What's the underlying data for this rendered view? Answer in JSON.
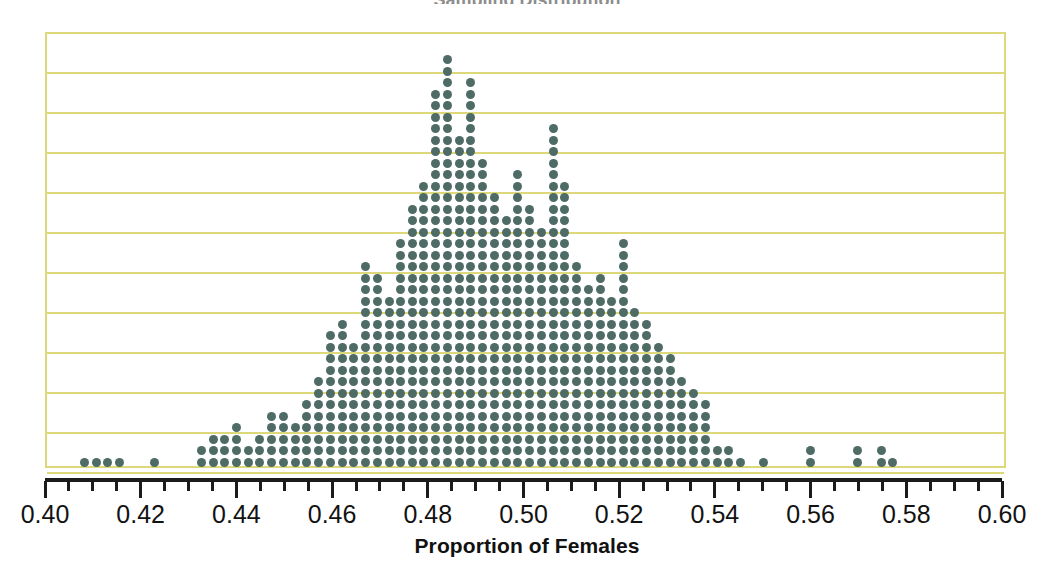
{
  "figure": {
    "width": 1054,
    "height": 566,
    "background": "#ffffff",
    "cropped_title_fragment": "Sampling Distribution"
  },
  "colors": {
    "dot": "#4e6b66",
    "gridline": "#ddd97a",
    "plot_border": "#ddd97a",
    "axis": "#1b1b1b",
    "text": "#121212",
    "background": "#ffffff"
  },
  "plot_box": {
    "left": 45,
    "top": 32,
    "right": 1006,
    "bottom": 468,
    "gridline_count": 11,
    "gridline_spacing_px": 40
  },
  "axis": {
    "line_y": 478,
    "x_min_px": 45,
    "x_max_px": 1002,
    "major_step": 0.02,
    "minor_step": 0.005,
    "title": "Proportion of Females",
    "tick_labels": [
      "0.40",
      "0.42",
      "0.44",
      "0.46",
      "0.48",
      "0.50",
      "0.52",
      "0.54",
      "0.56",
      "0.58",
      "0.60"
    ],
    "tick_values": [
      0.4,
      0.42,
      0.44,
      0.46,
      0.48,
      0.5,
      0.52,
      0.54,
      0.56,
      0.58,
      0.6
    ]
  },
  "dot_geometry": {
    "diameter_px": 9,
    "column_pitch_px": 11.7,
    "row_pitch_px": 11.5,
    "baseline_y_px": 462
  },
  "chart_data": {
    "type": "scatter",
    "plot_style": "dot-plot (stacked dots, one dot per observation)",
    "title": "",
    "xlabel": "Proportion of Females",
    "ylabel": "",
    "xlim": [
      0.4,
      0.6
    ],
    "ylim": [
      0,
      36
    ],
    "grid": "horizontal-only",
    "legend": "none",
    "x_tick_labels": [
      "0.40",
      "0.42",
      "0.44",
      "0.46",
      "0.48",
      "0.50",
      "0.52",
      "0.54",
      "0.56",
      "0.58",
      "0.60"
    ],
    "y_tick_labels": [],
    "annotations": [],
    "x_bin_width": 0.00245,
    "x": [
      0.4082,
      0.4107,
      0.4131,
      0.4156,
      0.4229,
      0.4327,
      0.4352,
      0.4376,
      0.44,
      0.4425,
      0.4449,
      0.4474,
      0.4498,
      0.4523,
      0.4547,
      0.4572,
      0.4596,
      0.4621,
      0.4645,
      0.467,
      0.4694,
      0.4719,
      0.4743,
      0.4768,
      0.4792,
      0.4817,
      0.4841,
      0.4866,
      0.489,
      0.4915,
      0.4939,
      0.4964,
      0.4988,
      0.5013,
      0.5037,
      0.5062,
      0.5086,
      0.5111,
      0.5135,
      0.516,
      0.5184,
      0.5209,
      0.5233,
      0.5258,
      0.5282,
      0.5307,
      0.5331,
      0.5356,
      0.538,
      0.5405,
      0.5429,
      0.5454,
      0.5502,
      0.56,
      0.5699,
      0.5748,
      0.5772
    ],
    "counts": [
      1,
      1,
      1,
      1,
      1,
      2,
      3,
      3,
      4,
      2,
      3,
      5,
      5,
      4,
      6,
      8,
      12,
      13,
      11,
      18,
      17,
      15,
      20,
      23,
      25,
      33,
      36,
      29,
      34,
      27,
      24,
      22,
      26,
      23,
      21,
      30,
      25,
      18,
      16,
      17,
      15,
      20,
      14,
      13,
      11,
      10,
      8,
      7,
      6,
      2,
      2,
      1,
      1,
      2,
      2,
      2,
      1
    ],
    "summary": {
      "n_observations_approx": 705,
      "center_approx": 0.487,
      "mode_bin": 0.4866,
      "max_stack_height": 36,
      "min_value": 0.4082,
      "max_value": 0.5772,
      "notable_features": [
        "tall isolated spike at 0.5062 reaching 30 dots",
        "secondary bump near 0.5209 reaching 20 dots",
        "sparse left tail between 0.408 and 0.423",
        "sparse right tail between 0.550 and 0.578"
      ]
    }
  }
}
